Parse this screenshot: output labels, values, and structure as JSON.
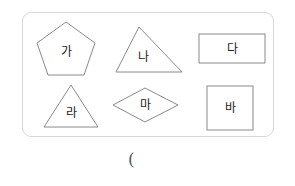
{
  "worksheet": {
    "container": {
      "border_color": "#d8d8d8",
      "background": "#ffffff"
    },
    "shape_stroke_color": "#8a8a8a",
    "label_color": "#1c1c1c",
    "shapes": [
      {
        "id": "pentagon",
        "label": "가",
        "shape_name": "pentagon",
        "row": 1,
        "column": 1
      },
      {
        "id": "triangle-na",
        "label": "나",
        "shape_name": "triangle",
        "row": 1,
        "column": 2
      },
      {
        "id": "rectangle-da",
        "label": "다",
        "shape_name": "rectangle",
        "row": 1,
        "column": 3
      },
      {
        "id": "triangle-ra",
        "label": "라",
        "shape_name": "triangle",
        "row": 2,
        "column": 1
      },
      {
        "id": "rhombus-ma",
        "label": "마",
        "shape_name": "rhombus",
        "row": 2,
        "column": 2
      },
      {
        "id": "square-ba",
        "label": "바",
        "shape_name": "square",
        "row": 2,
        "column": 3
      }
    ],
    "answer_blank": "(",
    "answer_blank_color": "#5a5a5a"
  }
}
